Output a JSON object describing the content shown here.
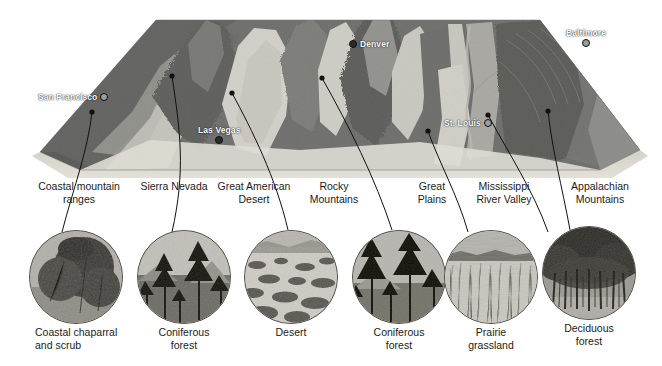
{
  "figure": {
    "kind": "cross-continental transect diagram",
    "background_color": "#ffffff",
    "line_color": "#111111"
  },
  "map": {
    "name": "shaded-relief-terrain-block",
    "cities": [
      {
        "name": "San Francisco",
        "x": 38,
        "y": 96,
        "dot_side": "right",
        "style": "hollow"
      },
      {
        "name": "Las Vegas",
        "x": 198,
        "y": 130,
        "dot_side": "below",
        "style": "solid"
      },
      {
        "name": "Denver",
        "x": 349,
        "y": 42,
        "dot_side": "left",
        "style": "solid"
      },
      {
        "name": "St. Louis",
        "x": 444,
        "y": 122,
        "dot_side": "right",
        "style": "hollow"
      },
      {
        "name": "Baltimore",
        "x": 568,
        "y": 33,
        "dot_side": "below",
        "style": "hollow"
      }
    ]
  },
  "regions": [
    {
      "label": "Coastal mountain\nranges",
      "x": 31,
      "width": 96
    },
    {
      "label": "Sierra Nevada",
      "x": 131,
      "width": 86
    },
    {
      "label": "Great American\nDesert",
      "x": 208,
      "width": 92
    },
    {
      "label": "Rocky\nMountains",
      "x": 295,
      "width": 78
    },
    {
      "label": "Great\nPlains",
      "x": 405,
      "width": 54
    },
    {
      "label": "Mississippi\nRiver Valley",
      "x": 458,
      "width": 92
    },
    {
      "label": "Appalachian\nMountains",
      "x": 558,
      "width": 84
    }
  ],
  "photos": [
    {
      "caption": "Coastal chaparral\nand scrub",
      "biome": "chaparral",
      "cx": 75,
      "cy": 276
    },
    {
      "caption": "Coniferous forest",
      "biome": "conifer",
      "cx": 183,
      "cy": 276
    },
    {
      "caption": "Desert",
      "biome": "desert",
      "cx": 290,
      "cy": 276
    },
    {
      "caption": "Coniferous forest",
      "biome": "conifer",
      "cx": 398,
      "cy": 276
    },
    {
      "caption": "Prairie grassland",
      "biome": "prairie",
      "cx": 490,
      "cy": 276
    },
    {
      "caption": "Deciduous forest",
      "biome": "deciduous",
      "cx": 588,
      "cy": 274
    }
  ],
  "leaders": [
    {
      "from_region": "Coastal mountain ranges",
      "map_point": [
        92,
        112
      ],
      "photo_point": [
        62,
        232
      ]
    },
    {
      "from_region": "Sierra Nevada",
      "map_point": [
        172,
        76
      ],
      "photo_point": [
        172,
        232
      ]
    },
    {
      "from_region": "Great American Desert",
      "map_point": [
        232,
        93
      ],
      "photo_point": [
        288,
        230
      ]
    },
    {
      "from_region": "Rocky Mountains",
      "map_point": [
        322,
        78
      ],
      "photo_point": [
        392,
        230
      ]
    },
    {
      "from_region": "Great Plains",
      "map_point": [
        428,
        131
      ],
      "photo_point": [
        468,
        232
      ]
    },
    {
      "from_region": "Mississippi River Valley",
      "map_point": [
        488,
        115
      ],
      "photo_point": [
        548,
        232
      ]
    },
    {
      "from_region": "Appalachian Mountains",
      "map_point": [
        548,
        111
      ],
      "photo_point": [
        570,
        230
      ]
    }
  ],
  "palette": {
    "coastal_dark": "#6e6e6e",
    "valley_light": "#d9d8d2",
    "highland": "#9b9b97",
    "plains_mid": "#7f7f7c",
    "foreground_sand": "#d8d5cd",
    "caption_color": "#1b1b1b",
    "city_label_color": "#ffffff"
  }
}
